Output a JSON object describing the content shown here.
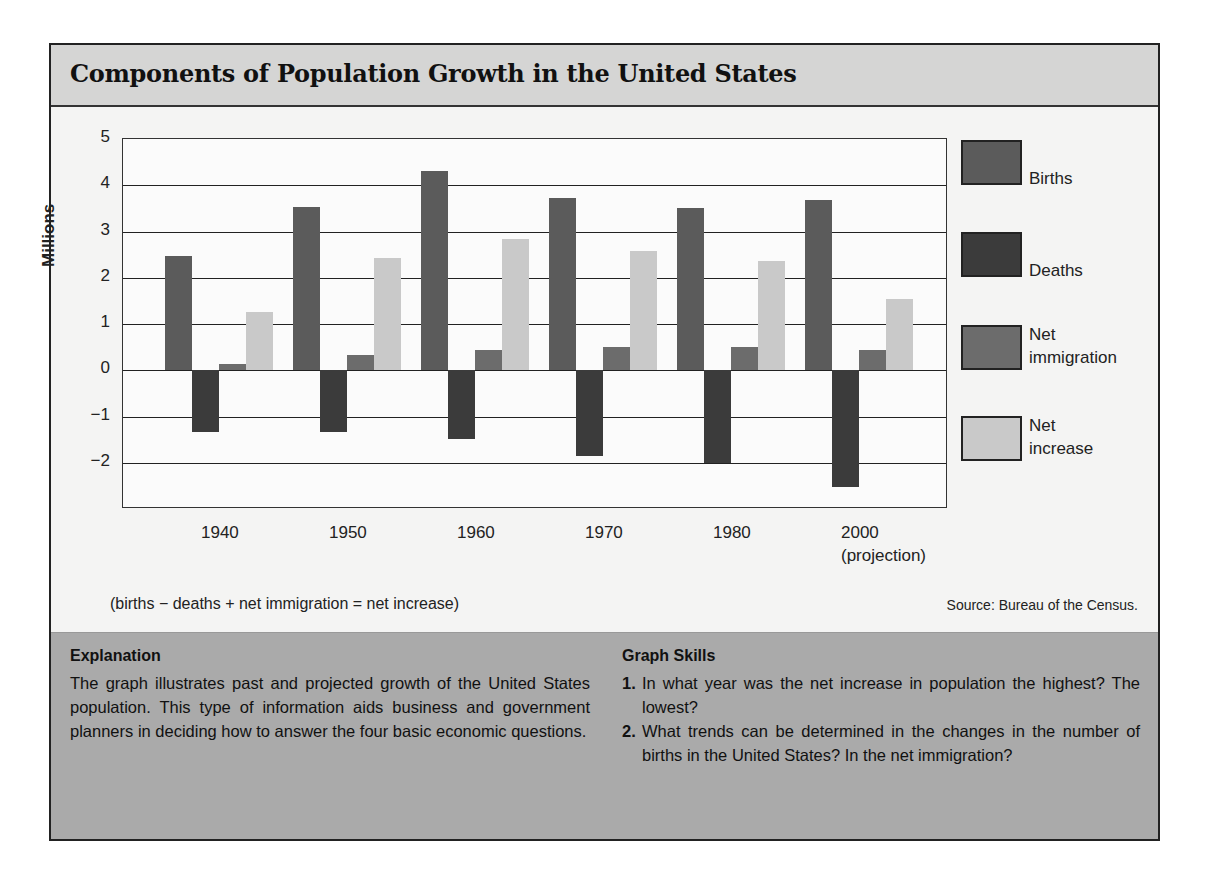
{
  "title": "Components of Population Growth in the United States",
  "chart_data": {
    "type": "bar",
    "title": "Components of Population Growth in the United States",
    "xlabel": "",
    "ylabel": "Millions",
    "ylim": [
      -3,
      5
    ],
    "yticks": [
      5,
      4,
      3,
      2,
      1,
      0,
      -1,
      -2
    ],
    "ytick_labels": [
      "5",
      "4",
      "3",
      "2",
      "1",
      "0",
      "−1",
      "−2"
    ],
    "grid": true,
    "legend_position": "right",
    "categories": [
      "1940",
      "1950",
      "1960",
      "1970",
      "1980",
      "2000"
    ],
    "category_sublabels": [
      "",
      "",
      "",
      "",
      "",
      "(projection)"
    ],
    "series": [
      {
        "name": "Births",
        "color": "#5b5b5b",
        "values": [
          2.46,
          3.53,
          4.3,
          3.73,
          3.5,
          3.68
        ]
      },
      {
        "name": "Deaths",
        "color": "#3b3b3b",
        "values": [
          -1.34,
          -1.33,
          -1.49,
          -1.86,
          -2.0,
          -2.53
        ]
      },
      {
        "name": "Net immigration",
        "color": "#6c6c6c",
        "values": [
          0.13,
          0.32,
          0.43,
          0.51,
          0.51,
          0.43
        ]
      },
      {
        "name": "Net increase",
        "color": "#c9c9c9",
        "values": [
          1.25,
          2.43,
          2.84,
          2.58,
          2.37,
          1.53
        ]
      }
    ],
    "annotations": [
      "(births − deaths + net immigration = net increase)",
      "Source: Bureau of the Census."
    ]
  },
  "legend": [
    {
      "line1": "Births",
      "line2": ""
    },
    {
      "line1": "Deaths",
      "line2": ""
    },
    {
      "line1": "Net",
      "line2": "immigration"
    },
    {
      "line1": "Net",
      "line2": "increase"
    }
  ],
  "formula": "(births − deaths + net immigration = net increase)",
  "source": "Source: Bureau of the Census.",
  "explanation": {
    "heading": "Explanation",
    "text": "The graph illustrates past and projected growth of the United States population. This type of information aids business and government planners in deciding how to answer the four basic economic questions."
  },
  "graph_skills": {
    "heading": "Graph Skills",
    "questions": [
      {
        "num": "1.",
        "text": "In what year was the net increase in population the highest? The lowest?"
      },
      {
        "num": "2.",
        "text": "What trends can be determined in the changes in the number of births in the United States? In the net immigration?"
      }
    ]
  }
}
